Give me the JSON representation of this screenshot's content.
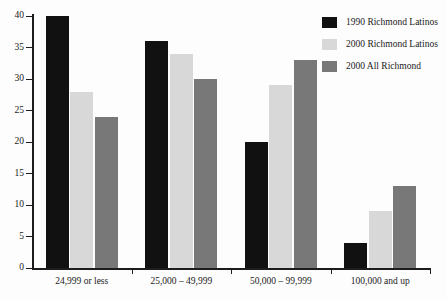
{
  "chart_data": {
    "type": "bar",
    "title": "",
    "subtitle": "",
    "xlabel": "",
    "ylabel": "",
    "ylim": [
      0,
      40
    ],
    "yticks": [
      0,
      5,
      10,
      15,
      20,
      25,
      30,
      35,
      40
    ],
    "grid": false,
    "legend_position": "top-right",
    "categories": [
      "24,999 or less",
      "25,000 – 49,999",
      "50,000 – 99,999",
      "100,000 and up"
    ],
    "series": [
      {
        "name": "1990 Richmond Latinos",
        "color": "#111111",
        "values": [
          40,
          36,
          20,
          4
        ]
      },
      {
        "name": "2000 Richmond Latinos",
        "color": "#d8d8d8",
        "values": [
          28,
          34,
          29,
          9
        ]
      },
      {
        "name": "2000 All Richmond",
        "color": "#787878",
        "values": [
          24,
          30,
          33,
          13
        ]
      }
    ]
  },
  "axes": {
    "y_tick_labels": [
      "0",
      "5",
      "10",
      "15",
      "20",
      "25",
      "30",
      "35",
      "40"
    ],
    "x_tick_labels": [
      "24,999 or less",
      "25,000 – 49,999",
      "50,000 – 99,999",
      "100,000 and up"
    ]
  },
  "legend": {
    "items": [
      {
        "label": "1990 Richmond Latinos",
        "color": "#111111"
      },
      {
        "label": "2000 Richmond Latinos",
        "color": "#d8d8d8"
      },
      {
        "label": "2000 All Richmond",
        "color": "#787878"
      }
    ]
  },
  "colors": {
    "background": "#fdfdfd",
    "axis": "#1c1c1c",
    "text": "#1a1a1a",
    "series_1990_richmond_latinos": "#111111",
    "series_2000_richmond_latinos": "#d8d8d8",
    "series_2000_all_richmond": "#787878"
  }
}
